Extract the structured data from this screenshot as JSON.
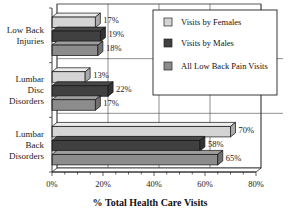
{
  "chart_data": {
    "type": "bar",
    "orientation": "horizontal",
    "style": "3d",
    "title": "",
    "xlabel": "% Total Health Care Visits",
    "ylabel": "",
    "xlim": [
      0,
      80
    ],
    "x_ticks": [
      "0%",
      "20%",
      "40%",
      "60%",
      "80%"
    ],
    "x_tick_values": [
      0,
      20,
      40,
      60,
      80
    ],
    "grid": true,
    "legend_position": "top-right",
    "categories": [
      "Low Back Injuries",
      "Lumbar Disc Disorders",
      "Lumbar Back Disorders"
    ],
    "category_lines": [
      [
        "Low Back",
        "Injuries"
      ],
      [
        "Lumbar",
        "Disc",
        "Disorders"
      ],
      [
        "Lumbar",
        "Back",
        "Disorders"
      ]
    ],
    "series": [
      {
        "name": "Visits by Females",
        "color": "#d4d4d4",
        "values": [
          17,
          13,
          70
        ],
        "labels": [
          "17%",
          "13%",
          "70%"
        ]
      },
      {
        "name": "Visits by Males",
        "color": "#404040",
        "values": [
          19,
          22,
          58
        ],
        "labels": [
          "19%",
          "22%",
          "58%"
        ]
      },
      {
        "name": "All Low Back Pain Visits",
        "color": "#8c8c8c",
        "values": [
          18,
          17,
          65
        ],
        "labels": [
          "18%",
          "17%",
          "65%"
        ]
      }
    ]
  }
}
